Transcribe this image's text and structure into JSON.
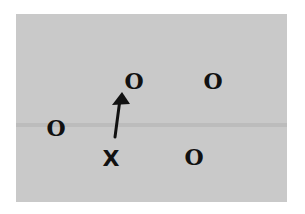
{
  "diagram": {
    "background_color": "#c9c9c9",
    "mark_color": "#111111",
    "marks": [
      {
        "id": "o1",
        "label": "O",
        "x": 122,
        "y": 70
      },
      {
        "id": "o2",
        "label": "O",
        "x": 201,
        "y": 70
      },
      {
        "id": "o3",
        "label": "O",
        "x": 44,
        "y": 117
      },
      {
        "id": "o4",
        "label": "O",
        "x": 182,
        "y": 146
      },
      {
        "id": "x1",
        "label": "X",
        "x": 101,
        "y": 148
      }
    ],
    "arrow": {
      "from": [
        115,
        137
      ],
      "to": [
        122,
        93
      ],
      "direction": "up"
    }
  }
}
